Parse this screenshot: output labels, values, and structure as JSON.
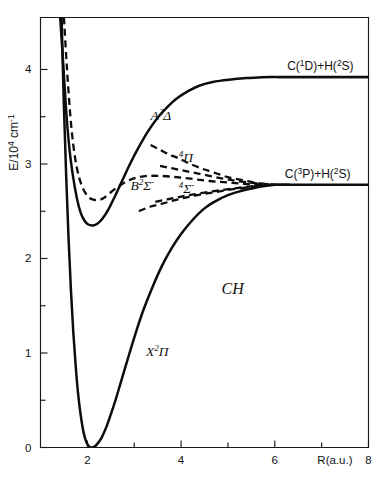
{
  "figure": {
    "molecule_label": "CH",
    "axes": {
      "x": {
        "title": "R(a.u.)",
        "min": 1.0,
        "max": 8.0,
        "major_ticks": [
          2,
          4,
          6,
          8
        ],
        "major_tick_labels": [
          "2",
          "4",
          "6",
          "8"
        ],
        "minor_ticks": [
          3,
          5,
          7
        ]
      },
      "y": {
        "title_main": "E/10",
        "title_sup1": "4",
        "title_unit": " cm",
        "title_sup2": "-1",
        "title_plain": "E/10^4 cm^-1",
        "min": 0.0,
        "max": 4.55,
        "major_ticks": [
          0,
          1,
          2,
          3,
          4
        ],
        "major_tick_labels": [
          "0",
          "1",
          "2",
          "3",
          "4"
        ],
        "minor_ticks": [
          0.5,
          1.5,
          2.5,
          3.5
        ]
      }
    },
    "dissociation_limits": [
      {
        "id": "limit-c1d",
        "energy": 3.92,
        "r_start": 6.05,
        "r_end": 8.0,
        "label_parts": {
          "a": "C(",
          "sup1": "1",
          "b": "D)+H(",
          "sup2": "2",
          "c": "S)"
        },
        "label_plain": "C(1D)+H(2S)"
      },
      {
        "id": "limit-c3p",
        "energy": 2.78,
        "r_start": 6.0,
        "r_end": 8.0,
        "label_parts": {
          "a": "C(",
          "sup1": "3",
          "b": "P)+H(",
          "sup2": "2",
          "c": "S)"
        },
        "label_plain": "C(3P)+H(2S)"
      }
    ],
    "curves": [
      {
        "id": "curve-x2pi",
        "style": "solid",
        "label_parts": {
          "letter": "X",
          "sup": "2",
          "term": "Π"
        },
        "label_plain": "X2Π",
        "label_r": 3.25,
        "label_e": 0.97,
        "minimum": {
          "r": 2.1,
          "e": 0.0
        },
        "asymptote": 2.78
      },
      {
        "id": "curve-a2delta",
        "style": "solid",
        "label_parts": {
          "letter": "A",
          "sup": "2",
          "term": "Δ"
        },
        "label_plain": "A2Δ",
        "label_r": 3.35,
        "label_e": 3.47,
        "minimum": {
          "r": 2.12,
          "e": 2.35
        },
        "asymptote": 3.92
      },
      {
        "id": "curve-b2sigma",
        "style": "dashed",
        "label_parts": {
          "letter": "B",
          "sup": "2",
          "term": "Σ",
          "supr": "-"
        },
        "label_plain": "B2Σ-",
        "label_r": 2.92,
        "label_e": 2.72,
        "minimum": {
          "r": 2.25,
          "e": 2.62
        },
        "asymptote": 2.78
      },
      {
        "id": "curve-4pi",
        "style": "dashed",
        "label_parts": {
          "sup": "4",
          "term": "Π"
        },
        "label_plain": "4Π",
        "label_r": 3.95,
        "label_e": 3.02,
        "asymptote": 2.78
      },
      {
        "id": "curve-4sigma",
        "style": "dashed",
        "label_parts": {
          "sup": "4",
          "term": "Σ",
          "supr": "-"
        },
        "label_plain": "4Σ-",
        "label_r": 3.95,
        "label_e": 2.69,
        "asymptote": 2.78
      }
    ]
  },
  "chart_data": {
    "type": "line",
    "title": "",
    "subtitle": "",
    "xlabel": "R(a.u.)",
    "ylabel": "E/10^4 cm^-1",
    "xlim": [
      1.0,
      8.0
    ],
    "ylim": [
      0.0,
      4.55
    ],
    "grid": false,
    "legend_position": "inline-labels",
    "annotations": [
      {
        "text": "CH",
        "r": 5.1,
        "e": 1.62
      },
      {
        "text": "C(1D)+H(2S)",
        "r": 6.25,
        "e": 4.05
      },
      {
        "text": "C(3P)+H(2S)",
        "r": 6.2,
        "e": 2.92
      }
    ],
    "series": [
      {
        "name": "X2Π",
        "style": "solid",
        "x": [
          1.45,
          1.5,
          1.55,
          1.6,
          1.65,
          1.7,
          1.75,
          1.8,
          1.85,
          1.9,
          1.95,
          2.0,
          2.05,
          2.1,
          2.15,
          2.2,
          2.3,
          2.4,
          2.5,
          2.6,
          2.75,
          2.9,
          3.05,
          3.2,
          3.4,
          3.6,
          3.8,
          4.0,
          4.25,
          4.5,
          4.75,
          5.0,
          5.25,
          5.5,
          5.75,
          6.0,
          6.3
        ],
        "y": [
          4.55,
          3.6,
          2.85,
          2.2,
          1.66,
          1.22,
          0.87,
          0.58,
          0.37,
          0.21,
          0.1,
          0.035,
          0.005,
          0.0,
          0.01,
          0.03,
          0.1,
          0.21,
          0.35,
          0.5,
          0.75,
          1.0,
          1.24,
          1.46,
          1.71,
          1.93,
          2.11,
          2.26,
          2.41,
          2.53,
          2.61,
          2.67,
          2.71,
          2.74,
          2.765,
          2.78,
          2.78
        ]
      },
      {
        "name": "A2Δ",
        "style": "solid",
        "x": [
          1.42,
          1.48,
          1.55,
          1.62,
          1.7,
          1.78,
          1.86,
          1.94,
          2.02,
          2.12,
          2.22,
          2.32,
          2.45,
          2.6,
          2.75,
          2.9,
          3.1,
          3.3,
          3.5,
          3.7,
          3.9,
          4.15,
          4.4,
          4.65,
          4.9,
          5.15,
          5.4,
          5.65,
          5.9,
          6.1,
          6.4,
          7.0,
          8.0
        ],
        "y": [
          4.55,
          4.1,
          3.55,
          3.15,
          2.85,
          2.63,
          2.48,
          2.4,
          2.36,
          2.35,
          2.37,
          2.42,
          2.52,
          2.67,
          2.83,
          2.99,
          3.18,
          3.35,
          3.49,
          3.6,
          3.69,
          3.77,
          3.83,
          3.865,
          3.885,
          3.9,
          3.91,
          3.915,
          3.92,
          3.92,
          3.92,
          3.92,
          3.92
        ]
      },
      {
        "name": "B2Σ-",
        "style": "dashed",
        "x": [
          1.5,
          1.56,
          1.63,
          1.7,
          1.78,
          1.86,
          1.95,
          2.05,
          2.15,
          2.25,
          2.35,
          2.45,
          2.6,
          2.75,
          2.9,
          3.05,
          3.2,
          3.35,
          3.5,
          3.7,
          3.9,
          4.1,
          4.35,
          4.6,
          4.85,
          5.1,
          5.35,
          5.6,
          5.85,
          6.0
        ],
        "y": [
          4.55,
          4.05,
          3.55,
          3.2,
          2.95,
          2.8,
          2.7,
          2.64,
          2.62,
          2.62,
          2.64,
          2.68,
          2.74,
          2.79,
          2.83,
          2.855,
          2.87,
          2.875,
          2.875,
          2.87,
          2.86,
          2.85,
          2.835,
          2.82,
          2.81,
          2.8,
          2.79,
          2.785,
          2.78,
          2.78
        ]
      },
      {
        "name": "4Π",
        "style": "dashed",
        "x": [
          3.35,
          3.55,
          3.75,
          3.95,
          4.2,
          4.45,
          4.7,
          5.0,
          5.3,
          5.6,
          5.85,
          6.0
        ],
        "y": [
          3.2,
          3.15,
          3.1,
          3.06,
          3.0,
          2.95,
          2.91,
          2.86,
          2.83,
          2.8,
          2.785,
          2.78
        ]
      },
      {
        "name": "4Σ-",
        "style": "dashed",
        "x": [
          3.1,
          3.35,
          3.6,
          3.85,
          4.1,
          4.4,
          4.7,
          5.0,
          5.3,
          5.6,
          5.85,
          6.0
        ],
        "y": [
          2.5,
          2.55,
          2.58,
          2.615,
          2.645,
          2.675,
          2.7,
          2.725,
          2.745,
          2.765,
          2.775,
          2.78
        ]
      },
      {
        "name": "quartet-upper-fan",
        "style": "dashed",
        "x": [
          3.55,
          3.8,
          4.05,
          4.3,
          4.6,
          4.9,
          5.2,
          5.5,
          5.75,
          6.0
        ],
        "y": [
          2.98,
          2.955,
          2.93,
          2.905,
          2.875,
          2.845,
          2.82,
          2.8,
          2.79,
          2.78
        ]
      },
      {
        "name": "quartet-lower-fan",
        "style": "dashed",
        "x": [
          3.45,
          3.7,
          3.95,
          4.2,
          4.5,
          4.8,
          5.1,
          5.4,
          5.7,
          6.0
        ],
        "y": [
          2.6,
          2.625,
          2.65,
          2.672,
          2.698,
          2.72,
          2.74,
          2.758,
          2.772,
          2.78
        ]
      }
    ]
  }
}
